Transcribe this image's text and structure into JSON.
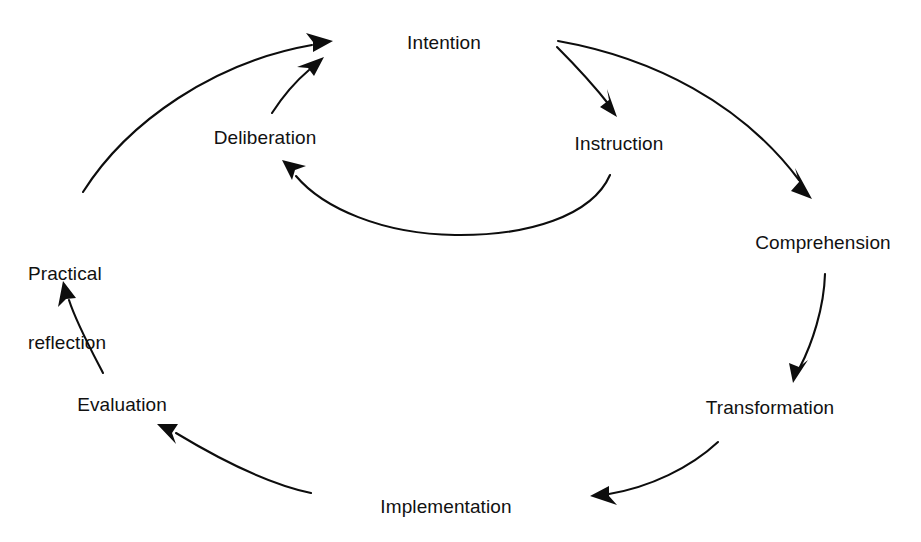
{
  "diagram": {
    "stroke_color": "#0d0d0d",
    "background_color": "#ffffff",
    "text_color": "#111111",
    "nodes": [
      {
        "id": "intention",
        "label": "Intention",
        "x": 444,
        "y": 42,
        "align": "center"
      },
      {
        "id": "instruction",
        "label": "Instruction",
        "x": 619,
        "y": 143,
        "align": "center"
      },
      {
        "id": "comprehension",
        "label": "Comprehension",
        "x": 823,
        "y": 242,
        "align": "center"
      },
      {
        "id": "transformation",
        "label": "Transformation",
        "x": 770,
        "y": 407,
        "align": "center"
      },
      {
        "id": "implementation",
        "label": "Implementation",
        "x": 446,
        "y": 506,
        "align": "center"
      },
      {
        "id": "evaluation",
        "label": "Evaluation",
        "x": 122,
        "y": 404,
        "align": "center"
      },
      {
        "id": "practical-reflection",
        "label": "Practical\nreflection",
        "x": 28,
        "y": 216,
        "align": "left",
        "line1": "Practical",
        "line2": "reflection"
      },
      {
        "id": "deliberation",
        "label": "Deliberation",
        "x": 265,
        "y": 137,
        "align": "center"
      }
    ],
    "edges": [
      {
        "id": "intention-to-instruction",
        "from": "Intention",
        "to": "Instruction"
      },
      {
        "id": "intention-to-comprehension",
        "from": "Intention",
        "to": "Comprehension"
      },
      {
        "id": "comprehension-to-transformation",
        "from": "Comprehension",
        "to": "Transformation"
      },
      {
        "id": "transformation-to-implementation",
        "from": "Transformation",
        "to": "Implementation"
      },
      {
        "id": "implementation-to-evaluation",
        "from": "Implementation",
        "to": "Evaluation"
      },
      {
        "id": "evaluation-to-practical-reflection",
        "from": "Evaluation",
        "to": "Practical reflection"
      },
      {
        "id": "practical-reflection-to-intention",
        "from": "Practical reflection",
        "to": "Intention"
      },
      {
        "id": "deliberation-to-intention",
        "from": "Deliberation",
        "to": "Intention"
      },
      {
        "id": "instruction-to-deliberation",
        "from": "Instruction",
        "to": "Deliberation"
      }
    ]
  }
}
